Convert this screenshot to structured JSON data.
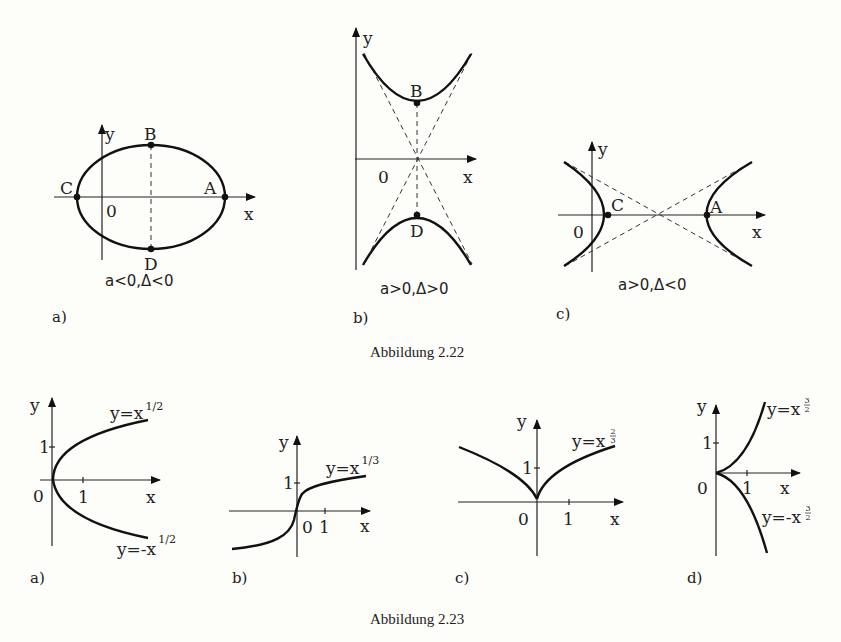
{
  "figure_2_22": {
    "caption": "Abbildung 2.22",
    "panels": [
      {
        "id": "a",
        "label": "a)",
        "condition": "a<0,Δ<0",
        "shape": "ellipse",
        "axis_x": "x",
        "axis_y": "y",
        "origin": "0",
        "points": [
          "A",
          "B",
          "C",
          "D"
        ]
      },
      {
        "id": "b",
        "label": "b)",
        "condition": "a>0,Δ>0",
        "shape": "vertical hyperbola",
        "axis_x": "x",
        "axis_y": "y",
        "origin": "0",
        "points": [
          "B",
          "D"
        ]
      },
      {
        "id": "c",
        "label": "c)",
        "condition": "a>0,Δ<0",
        "shape": "horizontal hyperbola",
        "axis_x": "x",
        "axis_y": "y",
        "origin": "0",
        "points": [
          "C",
          "A"
        ]
      }
    ]
  },
  "figure_2_23": {
    "caption": "Abbildung 2.23",
    "panels": [
      {
        "id": "a",
        "label": "a)",
        "axis_x": "x",
        "axis_y": "y",
        "origin": "0",
        "tick_x": "1",
        "tick_y": "1",
        "curves": [
          {
            "base": "y=x",
            "exponent": "1/2"
          },
          {
            "base": "y=-x",
            "exponent": "1/2"
          }
        ]
      },
      {
        "id": "b",
        "label": "b)",
        "axis_x": "x",
        "axis_y": "y",
        "origin": "0",
        "tick_x": "1",
        "tick_y": "1",
        "curves": [
          {
            "base": "y=x",
            "exponent": "1/3"
          }
        ]
      },
      {
        "id": "c",
        "label": "c)",
        "axis_x": "x",
        "axis_y": "y",
        "origin": "0",
        "tick_x": "1",
        "tick_y": "1",
        "curves": [
          {
            "base": "y=x",
            "exp_num": "2",
            "exp_den": "3"
          }
        ]
      },
      {
        "id": "d",
        "label": "d)",
        "axis_x": "x",
        "axis_y": "y",
        "origin": "0",
        "tick_x": "1",
        "tick_y": "1",
        "curves": [
          {
            "base": "y=x",
            "exp_num": "3",
            "exp_den": "2"
          },
          {
            "base": "y=-x",
            "exp_num": "3",
            "exp_den": "2"
          }
        ]
      }
    ]
  }
}
